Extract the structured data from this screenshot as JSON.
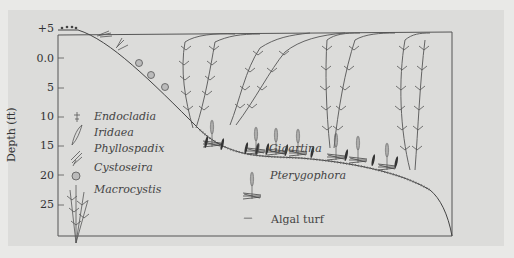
{
  "figure": {
    "y_axis": {
      "title": "Depth (ft)",
      "ticks": [
        "+5",
        "0.0",
        "5",
        "10",
        "15",
        "20",
        "25"
      ]
    },
    "legend": [
      {
        "name": "Endocladia",
        "icon": "endocladia-icon",
        "italic": true
      },
      {
        "name": "Iridaea",
        "icon": "iridaea-icon",
        "italic": true
      },
      {
        "name": "Phyllospadix",
        "icon": "phyllospadix-icon",
        "italic": true
      },
      {
        "name": "Cystoseira",
        "icon": "cystoseira-icon",
        "italic": true
      },
      {
        "name": "Macrocystis",
        "icon": "macrocystis-icon",
        "italic": true
      },
      {
        "name": "Gigartina",
        "icon": "gigartina-icon",
        "italic": true
      },
      {
        "name": "Pterygophora",
        "icon": "pterygophora-icon",
        "italic": true
      },
      {
        "name": "Algal turf",
        "icon": "algal-turf-icon",
        "italic": false
      }
    ],
    "colors": {
      "background": "#e9e9e7",
      "panel": "#dcdcda",
      "line": "#555555",
      "text": "#333333"
    }
  }
}
